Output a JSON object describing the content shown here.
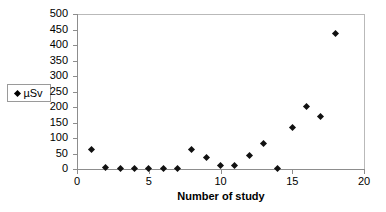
{
  "chart_data": {
    "type": "scatter",
    "title": "",
    "xlabel": "Number of study",
    "ylabel": "",
    "xlim": [
      0,
      20
    ],
    "ylim": [
      0,
      500
    ],
    "x_ticks": [
      0,
      5,
      10,
      15,
      20
    ],
    "x_tick_labels": [
      "0",
      "5",
      "10",
      "15",
      "20"
    ],
    "y_ticks": [
      0,
      50,
      100,
      150,
      200,
      250,
      300,
      350,
      400,
      450,
      500
    ],
    "y_tick_labels": [
      "0",
      "50",
      "100",
      "150",
      "200",
      "250",
      "300",
      "350",
      "400",
      "450",
      "500"
    ],
    "grid": false,
    "legend_position": "left-outside",
    "series": [
      {
        "name": "µSv",
        "marker": "diamond",
        "color": "#111111",
        "x": [
          1,
          2,
          3,
          4,
          5,
          6,
          7,
          8,
          9,
          10,
          11,
          12,
          13,
          14,
          15,
          16,
          17,
          18
        ],
        "values": [
          62,
          4,
          1,
          1,
          1,
          1,
          1,
          62,
          38,
          11,
          11,
          42,
          83,
          1,
          135,
          203,
          168,
          437
        ]
      }
    ]
  },
  "legend": {
    "marker_name": "diamond-marker",
    "label": "µSv"
  },
  "axes": {
    "x_title": "Number of study"
  }
}
